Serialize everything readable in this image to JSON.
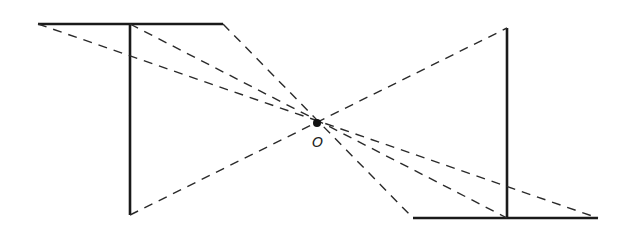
{
  "diagram": {
    "title": "",
    "center_label": "O"
  }
}
